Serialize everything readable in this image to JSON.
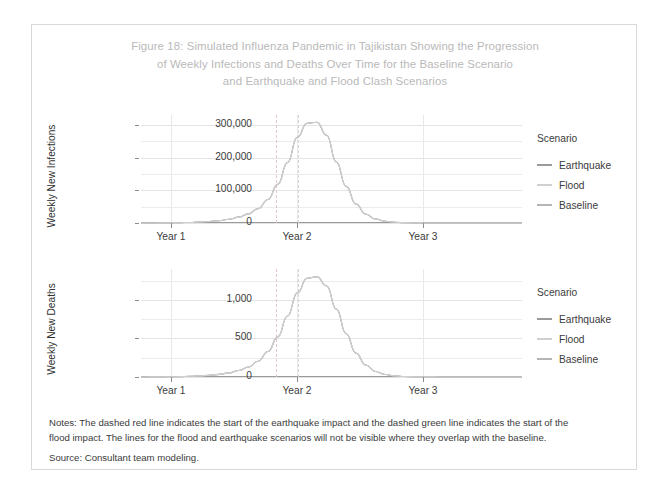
{
  "figure": {
    "title_lines": [
      "Figure 18: Simulated Influenza Pandemic in Tajikistan Showing the Progression",
      "of Weekly Infections and Deaths Over Time for the Baseline Scenario",
      "and Earthquake and Flood Clash Scenarios"
    ],
    "notes_lines": [
      "Notes: The dashed red line indicates the start of the earthquake impact and the dashed green line indicates the start of the",
      "flood impact. The lines for the flood and earthquake scenarios will not be visible where they overlap with the baseline."
    ],
    "source": "Source: Consultant team modeling."
  },
  "legend": {
    "title": "Scenario",
    "items": [
      {
        "label": "Earthquake",
        "color": "#9a9a9a"
      },
      {
        "label": "Flood",
        "color": "#d0d0d0"
      },
      {
        "label": "Baseline",
        "color": "#b5b5b5"
      }
    ]
  },
  "colors": {
    "title": "#b9b9b9",
    "text": "#3b3b3b",
    "grid": "#ececec",
    "axis": "#9a9a9a",
    "border": "#d9d9d9",
    "earthquake_marker": "#e3c8c8",
    "flood_marker": "#cfd9cf"
  },
  "chart_data": [
    {
      "type": "line",
      "panel": "infections",
      "title": "",
      "ylabel": "Weekly New Infections",
      "xlabel": "",
      "categories": [
        "Year 1",
        "Year 2",
        "Year 3"
      ],
      "xtick_labels": [
        "Year 1",
        "Year 2",
        "Year 3"
      ],
      "ytick_labels": [
        "0",
        "100,000",
        "200,000",
        "300,000"
      ],
      "ytick_values": [
        0,
        100000,
        200000,
        300000
      ],
      "ylim": [
        0,
        330000
      ],
      "grid": true,
      "legend_position": "right",
      "annotations": [
        {
          "name": "earthquake-start",
          "type": "vline",
          "style": "dashed",
          "color": "#e3c8c8"
        },
        {
          "name": "flood-start",
          "type": "vline",
          "style": "dashed",
          "color": "#cfd9cf"
        }
      ],
      "series": [
        {
          "name": "Baseline",
          "color": "#b5b5b5",
          "peak_value": 308000,
          "values": [
            0,
            120,
            260,
            520,
            980,
            1700,
            2900,
            4600,
            7200,
            11500,
            18000,
            28000,
            44000,
            72000,
            118000,
            185000,
            262000,
            305000,
            308000,
            268000,
            186000,
            112000,
            58000,
            27000,
            12000,
            5200,
            2300,
            1000,
            460,
            210,
            95,
            45,
            20,
            10,
            5,
            2,
            1,
            0,
            0,
            0
          ]
        },
        {
          "name": "Earthquake",
          "color": "#9a9a9a",
          "peak_value": 308000,
          "values": [
            0,
            120,
            260,
            520,
            980,
            1700,
            2900,
            4600,
            7200,
            11500,
            18000,
            28000,
            44000,
            72000,
            118000,
            185000,
            262000,
            305000,
            308000,
            268000,
            186000,
            112000,
            58000,
            27000,
            12000,
            5200,
            2300,
            1000,
            460,
            210,
            95,
            45,
            20,
            10,
            5,
            2,
            1,
            0,
            0,
            0
          ]
        },
        {
          "name": "Flood",
          "color": "#d0d0d0",
          "peak_value": 308000,
          "values": [
            0,
            120,
            260,
            520,
            980,
            1700,
            2900,
            4600,
            7200,
            11500,
            18000,
            28000,
            44000,
            72000,
            118000,
            185000,
            262000,
            305000,
            308000,
            268000,
            186000,
            112000,
            58000,
            27000,
            12000,
            5200,
            2300,
            1000,
            460,
            210,
            95,
            45,
            20,
            10,
            5,
            2,
            1,
            0,
            0,
            0
          ]
        }
      ]
    },
    {
      "type": "line",
      "panel": "deaths",
      "title": "",
      "ylabel": "Weekly New Deaths",
      "xlabel": "",
      "categories": [
        "Year 1",
        "Year 2",
        "Year 3"
      ],
      "xtick_labels": [
        "Year 1",
        "Year 2",
        "Year 3"
      ],
      "ytick_labels": [
        "0",
        "500",
        "1,000"
      ],
      "ytick_values": [
        0,
        500,
        1000
      ],
      "ylim": [
        0,
        1400
      ],
      "grid": true,
      "legend_position": "right",
      "annotations": [
        {
          "name": "earthquake-start",
          "type": "vline",
          "style": "dashed",
          "color": "#e3c8c8"
        },
        {
          "name": "flood-start",
          "type": "vline",
          "style": "dashed",
          "color": "#cfd9cf"
        }
      ],
      "series": [
        {
          "name": "Baseline",
          "color": "#b5b5b5",
          "peak_value": 1300,
          "values": [
            0,
            1,
            2,
            3,
            5,
            9,
            14,
            22,
            34,
            54,
            84,
            130,
            205,
            330,
            520,
            790,
            1090,
            1280,
            1300,
            1180,
            880,
            560,
            310,
            155,
            72,
            32,
            14,
            6,
            3,
            1,
            1,
            0,
            0,
            0,
            0,
            0,
            0,
            0,
            0,
            0
          ]
        },
        {
          "name": "Earthquake",
          "color": "#9a9a9a",
          "peak_value": 1300,
          "values": [
            0,
            1,
            2,
            3,
            5,
            9,
            14,
            22,
            34,
            54,
            84,
            130,
            205,
            330,
            520,
            790,
            1090,
            1280,
            1300,
            1180,
            880,
            560,
            310,
            155,
            72,
            32,
            14,
            6,
            3,
            1,
            1,
            0,
            0,
            0,
            0,
            0,
            0,
            0,
            0,
            0
          ]
        },
        {
          "name": "Flood",
          "color": "#d0d0d0",
          "peak_value": 1300,
          "values": [
            0,
            1,
            2,
            3,
            5,
            9,
            14,
            22,
            34,
            54,
            84,
            130,
            205,
            330,
            520,
            790,
            1090,
            1280,
            1300,
            1180,
            880,
            560,
            310,
            155,
            72,
            32,
            14,
            6,
            3,
            1,
            1,
            0,
            0,
            0,
            0,
            0,
            0,
            0,
            0,
            0
          ]
        }
      ]
    }
  ]
}
